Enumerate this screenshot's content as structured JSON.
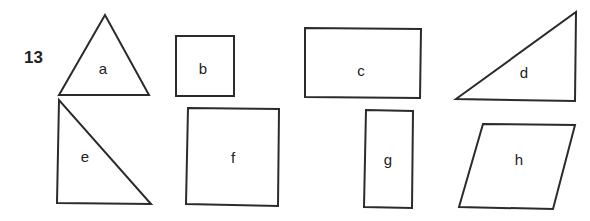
{
  "question_number": "13",
  "shapes": [
    {
      "label": "a",
      "kind": "equilateral-triangle"
    },
    {
      "label": "b",
      "kind": "square"
    },
    {
      "label": "c",
      "kind": "rectangle"
    },
    {
      "label": "d",
      "kind": "right-triangle"
    },
    {
      "label": "e",
      "kind": "right-triangle"
    },
    {
      "label": "f",
      "kind": "square"
    },
    {
      "label": "g",
      "kind": "rectangle"
    },
    {
      "label": "h",
      "kind": "parallelogram"
    }
  ]
}
